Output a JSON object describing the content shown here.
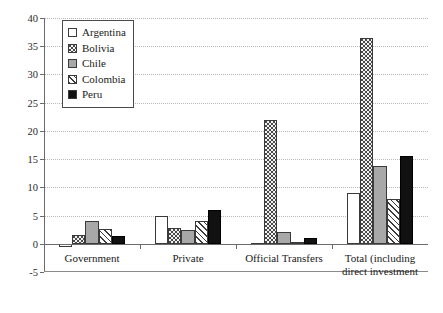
{
  "chart_data": {
    "type": "bar",
    "title": "",
    "subtitle": "",
    "xlabel": "",
    "ylabel": "",
    "ylim": [
      -5,
      40
    ],
    "ytick_step": 5,
    "yticks": [
      40,
      35,
      30,
      25,
      20,
      15,
      10,
      5,
      0,
      -5
    ],
    "grid": true,
    "legend_position": "top-left",
    "categories": [
      "Government",
      "Private",
      "Official Transfers",
      "Total (including direct investment"
    ],
    "series": [
      {
        "name": "Argentina",
        "pattern": "open-white",
        "color": "#ffffff",
        "values": [
          -0.5,
          5.0,
          0.1,
          9.0
        ]
      },
      {
        "name": "Bolivia",
        "pattern": "dotted-grid",
        "color": "#f2f2f2",
        "values": [
          1.5,
          2.8,
          22.0,
          36.5
        ]
      },
      {
        "name": "Chile",
        "pattern": "solid-gray",
        "color": "#a8a8a8",
        "values": [
          4.0,
          2.5,
          2.0,
          13.8
        ]
      },
      {
        "name": "Colombia",
        "pattern": "diagonal-hatch",
        "color": "#ffffff",
        "values": [
          2.6,
          4.1,
          0.4,
          8.0
        ]
      },
      {
        "name": "Peru",
        "pattern": "solid-black",
        "color": "#111111",
        "values": [
          1.4,
          6.0,
          1.0,
          15.6
        ]
      }
    ]
  },
  "legend": {
    "items": [
      {
        "label": "Argentina"
      },
      {
        "label": "Bolivia"
      },
      {
        "label": "Chile"
      },
      {
        "label": "Colombia"
      },
      {
        "label": "Peru"
      }
    ]
  }
}
